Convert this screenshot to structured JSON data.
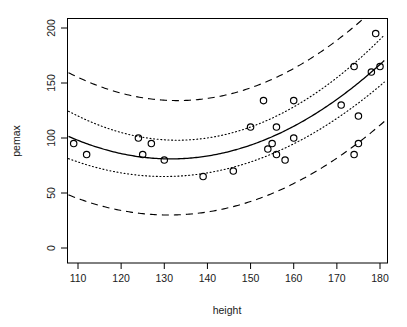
{
  "chart_data": {
    "type": "scatter",
    "title": "",
    "xlabel": "height",
    "ylabel": "pemax",
    "xlim": [
      107,
      181
    ],
    "ylim": [
      -5,
      208
    ],
    "xticks": [
      110,
      120,
      130,
      140,
      150,
      160,
      170,
      180
    ],
    "yticks": [
      0,
      50,
      100,
      150,
      200
    ],
    "grid": false,
    "legend": "none",
    "box": true,
    "point_symbol": "open-circle",
    "points": [
      {
        "x": 109,
        "y": 95
      },
      {
        "x": 112,
        "y": 85
      },
      {
        "x": 124,
        "y": 100
      },
      {
        "x": 125,
        "y": 85
      },
      {
        "x": 127,
        "y": 95
      },
      {
        "x": 130,
        "y": 80
      },
      {
        "x": 139,
        "y": 65
      },
      {
        "x": 146,
        "y": 70
      },
      {
        "x": 150,
        "y": 110
      },
      {
        "x": 153,
        "y": 134
      },
      {
        "x": 154,
        "y": 90
      },
      {
        "x": 155,
        "y": 95
      },
      {
        "x": 156,
        "y": 110
      },
      {
        "x": 156,
        "y": 85
      },
      {
        "x": 158,
        "y": 80
      },
      {
        "x": 160,
        "y": 100
      },
      {
        "x": 160,
        "y": 134
      },
      {
        "x": 171,
        "y": 130
      },
      {
        "x": 174,
        "y": 165
      },
      {
        "x": 174,
        "y": 85
      },
      {
        "x": 175,
        "y": 120
      },
      {
        "x": 175,
        "y": 95
      },
      {
        "x": 178,
        "y": 160
      },
      {
        "x": 179,
        "y": 195
      },
      {
        "x": 180,
        "y": 165
      }
    ],
    "curves": [
      {
        "name": "fitted-quadratic",
        "style": "solid",
        "a": 0.0365,
        "h": 131.5,
        "k": 81.0,
        "description": "fitted quadratic regression curve"
      },
      {
        "name": "confidence-upper",
        "style": "dotted",
        "a": 0.0415,
        "h": 133.0,
        "k": 98.0,
        "description": "upper confidence band"
      },
      {
        "name": "confidence-lower",
        "style": "dotted",
        "a": 0.033,
        "h": 130.0,
        "k": 65.0,
        "description": "lower confidence band"
      },
      {
        "name": "prediction-upper",
        "style": "dashed",
        "a": 0.04,
        "h": 133.0,
        "k": 134.0,
        "description": "upper prediction band"
      },
      {
        "name": "prediction-lower",
        "style": "dashed",
        "a": 0.034,
        "h": 131.0,
        "k": 30.0,
        "description": "lower prediction band"
      }
    ]
  }
}
